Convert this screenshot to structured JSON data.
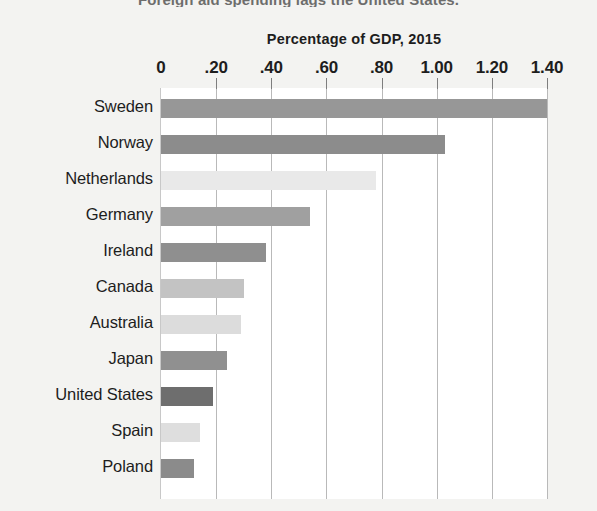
{
  "figure": {
    "headline": "Foreign aid spending lags the United States.",
    "axis_title": "Percentage of GDP, 2015"
  },
  "chart_data": {
    "type": "bar",
    "orientation": "horizontal",
    "title": "Percentage of GDP, 2015",
    "xlabel": "Percentage of GDP, 2015",
    "ylabel": "",
    "xlim": [
      0,
      1.4
    ],
    "grid": true,
    "legend": "none",
    "tick_labels": [
      "0",
      ".20",
      ".40",
      ".60",
      ".80",
      "1.00",
      "1.20",
      "1.40"
    ],
    "tick_values": [
      0,
      0.2,
      0.4,
      0.6,
      0.8,
      1.0,
      1.2,
      1.4
    ],
    "categories": [
      "Sweden",
      "Norway",
      "Netherlands",
      "Germany",
      "Ireland",
      "Canada",
      "Australia",
      "Japan",
      "United States",
      "Spain",
      "Poland"
    ],
    "values": [
      1.4,
      1.03,
      0.78,
      0.54,
      0.38,
      0.3,
      0.29,
      0.24,
      0.19,
      0.14,
      0.12
    ],
    "bar_colors": [
      "#979797",
      "#8c8c8c",
      "#e9e9e9",
      "#a0a0a0",
      "#8f8f8f",
      "#c3c3c3",
      "#dcdcdc",
      "#909090",
      "#6e6e6e",
      "#dedede",
      "#8b8b8b"
    ]
  },
  "style": {
    "plot_background": "#ffffff",
    "page_background": "#f3f3f1",
    "gridline_color": "#b9b9b9",
    "text_color": "#1d1d1d"
  }
}
